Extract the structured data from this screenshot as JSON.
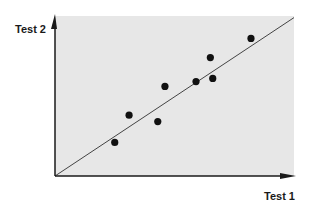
{
  "chart_data": {
    "type": "scatter",
    "title": "",
    "xlabel": "Test 1",
    "ylabel": "Test 2",
    "xlim": [
      0,
      100
    ],
    "ylim": [
      0,
      100
    ],
    "grid": false,
    "legend": null,
    "ticks": {
      "x": [],
      "y": []
    },
    "series": [
      {
        "name": "scores",
        "points": [
          {
            "x": 25,
            "y": 21
          },
          {
            "x": 31,
            "y": 38
          },
          {
            "x": 43,
            "y": 34
          },
          {
            "x": 46,
            "y": 56
          },
          {
            "x": 59,
            "y": 59
          },
          {
            "x": 65,
            "y": 74
          },
          {
            "x": 66,
            "y": 61
          },
          {
            "x": 82,
            "y": 86
          }
        ]
      }
    ],
    "reference_line": {
      "from": {
        "x": 0,
        "y": 0
      },
      "to": {
        "x": 100,
        "y": 99
      },
      "label": ""
    }
  },
  "colors": {
    "plot_background": "#e7e7e7",
    "axis": "#1a1a1a",
    "point": "#111111",
    "line": "#444444"
  }
}
